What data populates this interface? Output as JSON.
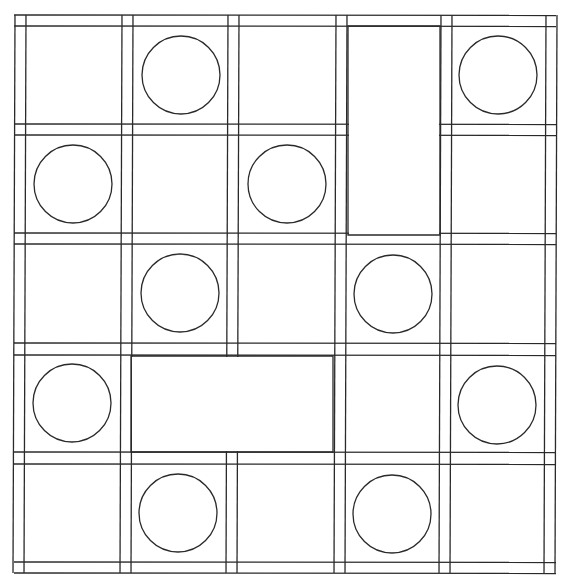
{
  "diagram": {
    "stroke_color": "#2a2a2a",
    "background": "#ffffff",
    "skew_px": 2,
    "grid": {
      "rows": 5,
      "cols": 5,
      "col_lines": [
        [
          14,
          25
        ],
        [
          121,
          132
        ],
        [
          227,
          238
        ],
        [
          335,
          346
        ],
        [
          440,
          451
        ],
        [
          545,
          556
        ]
      ],
      "row_lines": [
        [
          15,
          26
        ],
        [
          124,
          135
        ],
        [
          233,
          244
        ],
        [
          343,
          355
        ],
        [
          452,
          464
        ],
        [
          562,
          573
        ]
      ]
    },
    "circles": [
      {
        "row": 0,
        "col": 1,
        "cx": 181,
        "cy": 75,
        "r": 39
      },
      {
        "row": 0,
        "col": 4,
        "cx": 498,
        "cy": 75,
        "r": 39
      },
      {
        "row": 1,
        "col": 0,
        "cx": 73,
        "cy": 184,
        "r": 39
      },
      {
        "row": 1,
        "col": 2,
        "cx": 287,
        "cy": 184,
        "r": 39
      },
      {
        "row": 2,
        "col": 1,
        "cx": 180,
        "cy": 293,
        "r": 39
      },
      {
        "row": 2,
        "col": 3,
        "cx": 393,
        "cy": 294,
        "r": 39
      },
      {
        "row": 3,
        "col": 0,
        "cx": 72,
        "cy": 403,
        "r": 39
      },
      {
        "row": 3,
        "col": 4,
        "cx": 497,
        "cy": 405,
        "r": 39
      },
      {
        "row": 4,
        "col": 1,
        "cx": 178,
        "cy": 513,
        "r": 39
      },
      {
        "row": 4,
        "col": 3,
        "cx": 392,
        "cy": 514,
        "r": 39
      }
    ],
    "blocks": [
      {
        "name": "tall-block",
        "rows": [
          0,
          1
        ],
        "col": 3,
        "x": 348,
        "y": 26,
        "w": 92,
        "h": 209
      },
      {
        "name": "wide-block",
        "row": 3,
        "cols": [
          1,
          2
        ],
        "x": 131,
        "y": 356,
        "w": 202,
        "h": 96
      }
    ]
  }
}
